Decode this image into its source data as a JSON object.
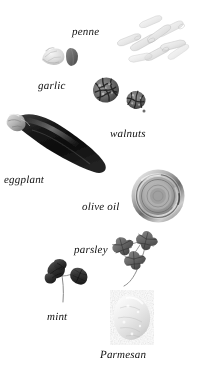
{
  "plate": {
    "width": 200,
    "height": 369,
    "background": "#ffffff",
    "rendering": "grayscale photographic plate of pasta ingredients on white background",
    "ink_color": "#111111"
  },
  "items": [
    {
      "id": "penne",
      "label": "penne",
      "icon": "penne-pasta-icon",
      "label_x": 72,
      "label_y": 27,
      "label_size": 11,
      "obj_x": 112,
      "obj_y": 10,
      "obj_w": 78,
      "obj_h": 58,
      "tone": "#e8e6e1",
      "description": "scattered pale cream pasta tubes"
    },
    {
      "id": "garlic",
      "label": "garlic",
      "icon": "garlic-bulb-icon",
      "label_x": 38,
      "label_y": 81,
      "label_size": 11,
      "obj_x": 40,
      "obj_y": 44,
      "obj_w": 42,
      "obj_h": 24,
      "tone": "#d8d6d2",
      "description": "pale garlic bulb with a darker single clove"
    },
    {
      "id": "walnuts",
      "label": "walnuts",
      "icon": "walnut-halves-icon",
      "label_x": 110,
      "label_y": 129,
      "label_size": 11,
      "obj_x": 88,
      "obj_y": 74,
      "obj_w": 62,
      "obj_h": 42,
      "tone": "#55504b",
      "description": "two dark textured walnut halves"
    },
    {
      "id": "eggplant",
      "label": "eggplant",
      "icon": "eggplant-icon",
      "label_x": 4,
      "label_y": 175,
      "label_size": 11,
      "obj_x": 2,
      "obj_y": 106,
      "obj_w": 112,
      "obj_h": 72,
      "tone": "#141416",
      "description": "large dark glossy eggplant lying diagonally with pale calyx"
    },
    {
      "id": "olive-oil",
      "label": "olive oil",
      "icon": "olive-oil-jar-icon",
      "label_x": 82,
      "label_y": 202,
      "label_size": 11,
      "obj_x": 130,
      "obj_y": 168,
      "obj_w": 56,
      "obj_h": 56,
      "tone": "#9a9894",
      "description": "round metal jar of oil seen from above, concentric rings"
    },
    {
      "id": "parsley",
      "label": "parsley",
      "icon": "parsley-sprig-icon",
      "label_x": 74,
      "label_y": 245,
      "label_size": 11,
      "obj_x": 104,
      "obj_y": 228,
      "obj_w": 62,
      "obj_h": 60,
      "tone": "#6e6c69",
      "description": "sprig with three lobed flat parsley leaves on thin stem"
    },
    {
      "id": "mint",
      "label": "mint",
      "icon": "mint-sprig-icon",
      "label_x": 47,
      "label_y": 312,
      "label_size": 11,
      "obj_x": 42,
      "obj_y": 258,
      "obj_w": 50,
      "obj_h": 48,
      "tone": "#3a3936",
      "description": "small dark mint sprig with rounded leaves"
    },
    {
      "id": "parmesan",
      "label": "Parmesan",
      "icon": "parmesan-wedge-icon",
      "label_x": 100,
      "label_y": 350,
      "label_size": 11,
      "obj_x": 110,
      "obj_y": 292,
      "obj_w": 50,
      "obj_h": 50,
      "tone": "#efeee9",
      "description": "pale grainy wedge of Parmesan cheese"
    }
  ]
}
